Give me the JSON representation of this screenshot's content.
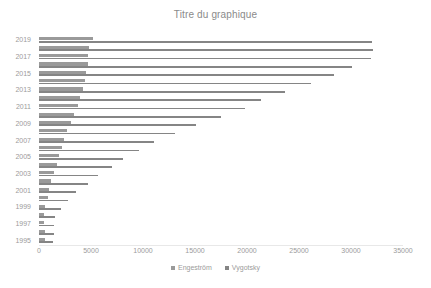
{
  "chart_data": {
    "type": "bar",
    "orientation": "horizontal",
    "title": "Titre du graphique",
    "xlabel": "",
    "ylabel": "",
    "xlim": [
      0,
      35000
    ],
    "xticks": [
      0,
      5000,
      10000,
      15000,
      20000,
      25000,
      30000,
      35000
    ],
    "xtick_labels": [
      "0",
      "5000",
      "10000",
      "15000",
      "20000",
      "25000",
      "30000",
      "35000"
    ],
    "grid": false,
    "legend_position": "bottom",
    "categories": [
      "2019",
      "2018",
      "2017",
      "2016",
      "2015",
      "2014",
      "2013",
      "2012",
      "2011",
      "2010",
      "2009",
      "2008",
      "2007",
      "2006",
      "2005",
      "2004",
      "2003",
      "2002",
      "2001",
      "2000",
      "1999",
      "1998",
      "1997",
      "1996",
      "1995"
    ],
    "ytick_labels": [
      "2019",
      "2017",
      "2015",
      "2013",
      "2011",
      "2009",
      "2007",
      "2005",
      "2003",
      "2001",
      "1999",
      "1997",
      "1995"
    ],
    "series": [
      {
        "name": "Engeström",
        "color": "#9a9a9a",
        "values": [
          5200,
          4850,
          4750,
          4700,
          4550,
          4400,
          4250,
          3900,
          3750,
          3400,
          3100,
          2700,
          2450,
          2200,
          1950,
          1700,
          1450,
          1200,
          1000,
          820,
          620,
          500,
          520,
          560,
          610
        ]
      },
      {
        "name": "Vygotsky",
        "color": "#858585",
        "values": [
          32000,
          32100,
          31900,
          30100,
          28400,
          26200,
          23700,
          21300,
          19800,
          17500,
          15100,
          13100,
          11100,
          9600,
          8100,
          7000,
          5700,
          4700,
          3600,
          2800,
          2100,
          1500,
          1450,
          1400,
          1300
        ]
      }
    ]
  },
  "legend": {
    "items": [
      {
        "label": "Engeström",
        "color": "#9a9a9a"
      },
      {
        "label": "Vygotsky",
        "color": "#858585"
      }
    ]
  }
}
